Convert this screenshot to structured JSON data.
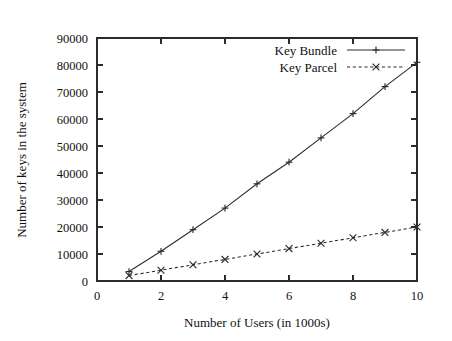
{
  "chart_data": {
    "type": "line",
    "title": "",
    "xlabel": "Number of Users (in 1000s)",
    "ylabel": "Number of keys in the system",
    "xlim": [
      0,
      10
    ],
    "ylim": [
      0,
      90000
    ],
    "grid": false,
    "legend_position": "top-right",
    "x_ticks": [
      "0",
      "2",
      "4",
      "6",
      "8",
      "10"
    ],
    "x_tick_values": [
      0,
      2,
      4,
      6,
      8,
      10
    ],
    "y_ticks": [
      "0",
      "10000",
      "20000",
      "30000",
      "40000",
      "50000",
      "60000",
      "70000",
      "80000",
      "90000"
    ],
    "y_tick_values": [
      0,
      10000,
      20000,
      30000,
      40000,
      50000,
      60000,
      70000,
      80000,
      90000
    ],
    "x": [
      1,
      2,
      3,
      4,
      5,
      6,
      7,
      8,
      9,
      10
    ],
    "series": [
      {
        "name": "Key Bundle",
        "marker": "plus",
        "linestyle": "solid",
        "color": "#2b2b2b",
        "values": [
          3500,
          11000,
          19000,
          27000,
          36000,
          44000,
          53000,
          62000,
          72000,
          81000
        ]
      },
      {
        "name": "Key Parcel",
        "marker": "cross",
        "linestyle": "dashed",
        "color": "#2b2b2b",
        "values": [
          2000,
          4000,
          6000,
          8000,
          10000,
          12000,
          14000,
          16000,
          18000,
          20000
        ]
      }
    ]
  },
  "legend": {
    "entries": [
      {
        "label": "Key Bundle"
      },
      {
        "label": "Key Parcel"
      }
    ]
  }
}
